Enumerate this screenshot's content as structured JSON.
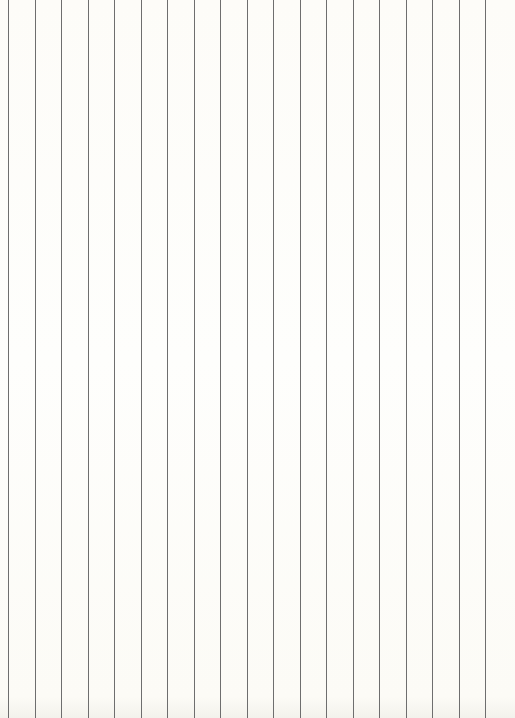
{
  "page": {
    "type": "vertically-ruled-paper",
    "background_color": "#fdfcf8",
    "line_color": "#6e6e6e",
    "line_count": 19,
    "line_positions_x": [
      8,
      35,
      61,
      88,
      114,
      141,
      167,
      194,
      220,
      247,
      273,
      300,
      326,
      353,
      379,
      406,
      432,
      459,
      485
    ]
  }
}
